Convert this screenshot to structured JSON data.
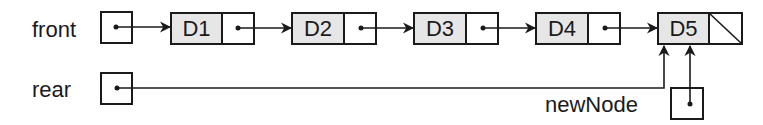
{
  "diagram": {
    "type": "linked-list-queue",
    "pointers": {
      "front": {
        "label": "front",
        "points_to": "D1"
      },
      "rear": {
        "label": "rear",
        "points_to": "D5"
      },
      "newNode": {
        "label": "newNode",
        "points_to": "D5"
      }
    },
    "nodes": [
      {
        "id": "D1",
        "label": "D1",
        "next": "D2"
      },
      {
        "id": "D2",
        "label": "D2",
        "next": "D3"
      },
      {
        "id": "D3",
        "label": "D3",
        "next": "D4"
      },
      {
        "id": "D4",
        "label": "D4",
        "next": "D5"
      },
      {
        "id": "D5",
        "label": "D5",
        "next": null
      }
    ],
    "colors": {
      "data_fill": "#e6e6e6",
      "stroke": "#1a1a1a",
      "background": "#ffffff"
    }
  }
}
